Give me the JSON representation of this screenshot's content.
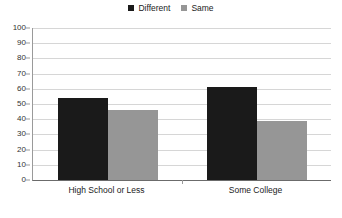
{
  "chart_data": {
    "type": "bar",
    "title": "",
    "subtitle": "",
    "xlabel": "",
    "ylabel": "",
    "ylim": [
      0,
      100
    ],
    "ytick_step": 10,
    "yticks": [
      100,
      90,
      80,
      70,
      60,
      50,
      40,
      30,
      20,
      10,
      0
    ],
    "grid": true,
    "legend_position": "top-center",
    "categories": [
      "High School or Less",
      "Some College"
    ],
    "series": [
      {
        "name": "Different",
        "color": "#1a1a1a",
        "values": [
          54,
          61
        ]
      },
      {
        "name": "Same",
        "color": "#969696",
        "values": [
          46,
          39
        ]
      }
    ]
  },
  "legend": {
    "entries": [
      {
        "label": "Different",
        "swatch_name": "legend-swatch-different"
      },
      {
        "label": "Same",
        "swatch_name": "legend-swatch-same"
      }
    ]
  }
}
